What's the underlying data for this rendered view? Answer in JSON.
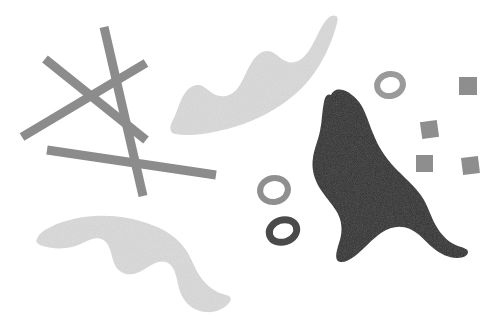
{
  "canvas": {
    "width": 498,
    "height": 331,
    "background_color": "#ffffff",
    "description": "Abstract composition of gray sticks, wavy leaf blobs, rings and squares on white"
  },
  "palette": {
    "background": "#ffffff",
    "stick_gray": "#8c8c8c",
    "light_blob_gray": "#dcdcdc",
    "dark_blob": "#2e2e2e",
    "ring_light_gray": "#9a9a9a",
    "ring_dark_gray": "#4a4a4a",
    "square_gray": "#8e8e8e"
  },
  "shapes": {
    "sticks": [
      {
        "name": "stick-diagonal-nw-se",
        "x1": 45,
        "y1": 59,
        "x2": 146,
        "y2": 140,
        "thickness": 9,
        "color": "#8c8c8c"
      },
      {
        "name": "stick-diagonal-ne-sw",
        "x1": 146,
        "y1": 63,
        "x2": 22,
        "y2": 137,
        "thickness": 9,
        "color": "#8c8c8c"
      },
      {
        "name": "stick-steep-vertical",
        "x1": 104,
        "y1": 27,
        "x2": 143,
        "y2": 196,
        "thickness": 9,
        "color": "#8c8c8c"
      },
      {
        "name": "stick-long-horizontal",
        "x1": 47,
        "y1": 150,
        "x2": 216,
        "y2": 175,
        "thickness": 9,
        "color": "#8c8c8c"
      }
    ],
    "blobs": [
      {
        "name": "light-leaf-blob-upper",
        "color": "#dcdcdc",
        "bounds": {
          "x": 168,
          "y": 14,
          "width": 170,
          "height": 124
        }
      },
      {
        "name": "light-leaf-blob-lower-left",
        "color": "#dcdcdc",
        "bounds": {
          "x": 36,
          "y": 214,
          "width": 196,
          "height": 100
        }
      },
      {
        "name": "dark-leaf-blob-right",
        "color": "#2e2e2e",
        "bounds": {
          "x": 312,
          "y": 94,
          "width": 158,
          "height": 168
        }
      }
    ],
    "rings": [
      {
        "name": "ring-upper-right",
        "cx": 390,
        "cy": 85,
        "rx": 13,
        "ry": 11,
        "stroke_width": 6,
        "rotation": -12,
        "color": "#9a9a9a"
      },
      {
        "name": "ring-middle-light",
        "cx": 274,
        "cy": 190,
        "rx": 14,
        "ry": 12,
        "stroke_width": 6,
        "rotation": -10,
        "color": "#8f8f8f"
      },
      {
        "name": "ring-lower-dark",
        "cx": 283,
        "cy": 231,
        "rx": 14,
        "ry": 11,
        "stroke_width": 7,
        "rotation": -18,
        "color": "#4a4a4a"
      }
    ],
    "squares": [
      {
        "name": "square-top-right",
        "x": 459,
        "y": 77,
        "size": 18,
        "rotation": 0,
        "color": "#8e8e8e"
      },
      {
        "name": "square-middle",
        "x": 421,
        "y": 121,
        "size": 17,
        "rotation": -8,
        "color": "#8e8e8e"
      },
      {
        "name": "square-bottom-left",
        "x": 416,
        "y": 155,
        "size": 17,
        "rotation": 0,
        "color": "#8e8e8e"
      },
      {
        "name": "square-bottom-right",
        "x": 462,
        "y": 157,
        "size": 17,
        "rotation": -7,
        "color": "#8e8e8e"
      }
    ]
  }
}
